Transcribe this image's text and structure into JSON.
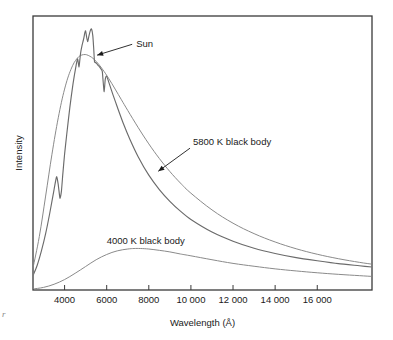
{
  "figure": {
    "axis_label_x": "Wavelength  (Å)",
    "axis_label_y": "Intensity",
    "annotations": {
      "sun": "Sun",
      "bb5800": "5800 K black body",
      "bb4000": "4000 K black body"
    },
    "artifact_mark": "r",
    "colors": {
      "frame": "#3a3a3a",
      "curve_sun": "#6b6b6b",
      "curve_5800": "#8a8a8a",
      "curve_4000": "#8a8a8a",
      "text": "#1a1a1a",
      "background": "#ffffff"
    }
  },
  "chart_data": {
    "type": "line",
    "title": "",
    "xlabel": "Wavelength  (Å)",
    "ylabel": "Intensity",
    "xlim": [
      2500,
      18600
    ],
    "ylim": [
      0,
      1.05
    ],
    "grid": false,
    "legend": "none",
    "xticks": [
      4000,
      6000,
      8000,
      10000,
      12000,
      14000,
      16000
    ],
    "xticklabels": [
      "4000",
      "6000",
      "8000",
      "10 000",
      "12 000",
      "14 000",
      "16 000"
    ],
    "yticks": [],
    "yticklabels": [],
    "annotations": [
      {
        "text": "Sun",
        "x": 7400,
        "y": 0.93,
        "arrow_to_x": 5450,
        "arrow_to_y": 0.9
      },
      {
        "text": "5800 K black body",
        "x": 10100,
        "y": 0.555,
        "arrow_to_x": 8450,
        "arrow_to_y": 0.455
      },
      {
        "text": "4000 K black body",
        "x": 6000,
        "y": 0.175,
        "arrow_to_x": null,
        "arrow_to_y": null
      }
    ],
    "series": [
      {
        "name": "5800 K black body",
        "color": "#8a8a8a",
        "x": [
          2500,
          2800,
          3100,
          3400,
          3700,
          4000,
          4300,
          4600,
          4900,
          5200,
          5500,
          5800,
          6100,
          6400,
          6700,
          7000,
          7500,
          8000,
          8500,
          9000,
          9500,
          10000,
          11000,
          12000,
          13000,
          14000,
          15000,
          16000,
          17000,
          18000,
          18600
        ],
        "y": [
          0.085,
          0.205,
          0.36,
          0.52,
          0.66,
          0.77,
          0.845,
          0.888,
          0.902,
          0.896,
          0.876,
          0.846,
          0.81,
          0.77,
          0.729,
          0.688,
          0.622,
          0.56,
          0.504,
          0.454,
          0.41,
          0.371,
          0.307,
          0.256,
          0.216,
          0.184,
          0.158,
          0.137,
          0.12,
          0.106,
          0.099
        ]
      },
      {
        "name": "Sun",
        "color": "#6b6b6b",
        "x": [
          2500,
          2700,
          2900,
          3100,
          3300,
          3500,
          3620,
          3700,
          3780,
          3850,
          3920,
          4000,
          4100,
          4250,
          4400,
          4550,
          4620,
          4680,
          4720,
          4760,
          4820,
          4900,
          4960,
          5000,
          5050,
          5100,
          5160,
          5230,
          5280,
          5340,
          5380,
          5420,
          5470,
          5520,
          5580,
          5650,
          5720,
          5790,
          5830,
          5880,
          5930,
          5990,
          6060,
          6150,
          6300,
          6500,
          6800,
          7100,
          7500,
          8000,
          8500,
          9000,
          9500,
          10000,
          11000,
          12000,
          13000,
          14000,
          15000,
          16000,
          17000,
          18000,
          18600
        ],
        "y": [
          0.055,
          0.095,
          0.15,
          0.216,
          0.296,
          0.385,
          0.434,
          0.403,
          0.352,
          0.379,
          0.448,
          0.52,
          0.595,
          0.7,
          0.79,
          0.862,
          0.886,
          0.855,
          0.878,
          0.908,
          0.934,
          0.96,
          0.985,
          0.993,
          0.968,
          0.952,
          0.975,
          0.996,
          1.0,
          0.975,
          0.93,
          0.876,
          0.872,
          0.868,
          0.862,
          0.856,
          0.848,
          0.838,
          0.8,
          0.76,
          0.806,
          0.82,
          0.806,
          0.784,
          0.748,
          0.702,
          0.636,
          0.578,
          0.51,
          0.44,
          0.385,
          0.34,
          0.302,
          0.27,
          0.222,
          0.187,
          0.16,
          0.14,
          0.124,
          0.112,
          0.101,
          0.093,
          0.088
        ]
      },
      {
        "name": "4000 K black body",
        "color": "#8a8a8a",
        "x": [
          2500,
          3000,
          3500,
          4000,
          4500,
          5000,
          5500,
          6000,
          6500,
          7000,
          7300,
          7600,
          8000,
          8500,
          9000,
          9500,
          10000,
          11000,
          12000,
          13000,
          14000,
          15000,
          16000,
          17000,
          18000,
          18600
        ],
        "y": [
          0.004,
          0.01,
          0.022,
          0.04,
          0.064,
          0.09,
          0.116,
          0.136,
          0.15,
          0.157,
          0.159,
          0.159,
          0.157,
          0.152,
          0.146,
          0.138,
          0.131,
          0.116,
          0.102,
          0.091,
          0.081,
          0.073,
          0.066,
          0.06,
          0.055,
          0.052
        ]
      }
    ]
  }
}
